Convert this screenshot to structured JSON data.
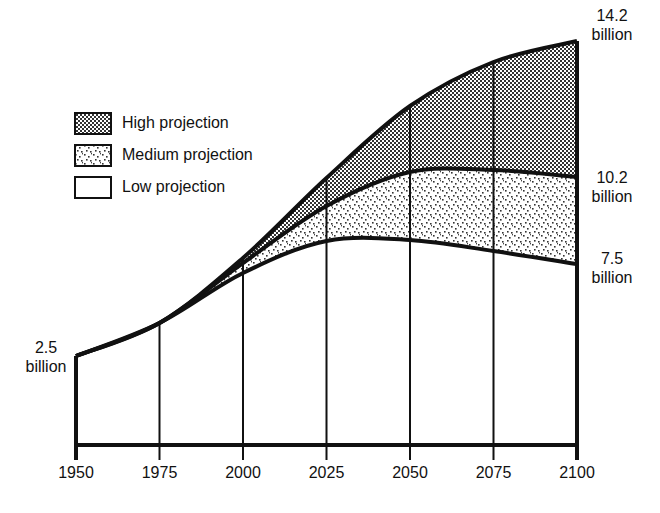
{
  "chart_data": {
    "type": "area",
    "title": "",
    "xlabel": "",
    "ylabel": "",
    "x": [
      1950,
      1975,
      2000,
      2025,
      2050,
      2075,
      2100
    ],
    "series": [
      {
        "name": "High projection",
        "values": [
          2.5,
          4.1,
          6.2,
          8.6,
          11.1,
          12.9,
          14.2
        ],
        "pattern": "dense-dots"
      },
      {
        "name": "Medium projection",
        "values": [
          2.5,
          4.1,
          6.0,
          7.7,
          9.0,
          10.3,
          10.2
        ],
        "pattern": "sparse-dots"
      },
      {
        "name": "Low projection",
        "values": [
          2.5,
          4.1,
          5.6,
          6.8,
          6.8,
          7.1,
          7.5
        ],
        "pattern": "none"
      }
    ],
    "annotations": [
      {
        "text": "2.5\nbillion",
        "at": "1950 start value"
      },
      {
        "text": "14.2\nbillion",
        "at": "2100 high"
      },
      {
        "text": "10.2\nbillion",
        "at": "2100 medium"
      },
      {
        "text": "7.5\nbillion",
        "at": "2100 low"
      }
    ],
    "x_ticks": [
      "1950",
      "1975",
      "2000",
      "2025",
      "2050",
      "2075",
      "2100"
    ],
    "grid": "vertical lines at each tick",
    "legend_position": "upper-left"
  },
  "legend": [
    {
      "label": "High projection"
    },
    {
      "label": "Medium projection"
    },
    {
      "label": "Low projection"
    }
  ],
  "labels": {
    "start": {
      "value": "2.5",
      "unit": "billion"
    },
    "high_end": {
      "value": "14.2",
      "unit": "billion"
    },
    "medium_end": {
      "value": "10.2",
      "unit": "billion"
    },
    "low_end": {
      "value": "7.5",
      "unit": "billion"
    }
  },
  "colors": {
    "ink": "#111111",
    "background": "#ffffff"
  }
}
